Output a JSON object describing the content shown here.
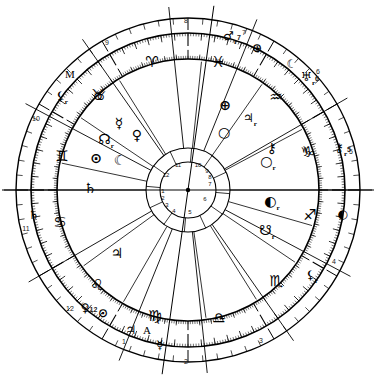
{
  "chart": {
    "type": "astrological-natal-wheel",
    "center_dot": true,
    "rings": {
      "outer_circle_r": 172,
      "zodiac_band_outer_r": 157,
      "zodiac_band_inner_r": 131,
      "inner_house_ring_outer_r": 42,
      "inner_house_ring_inner_r": 28
    }
  },
  "angles": [
    {
      "name": "midheaven",
      "label": "M",
      "x": 70,
      "y": 74
    },
    {
      "name": "ascendant",
      "label": "A",
      "x": 147,
      "y": 330
    }
  ],
  "zodiac_signs": [
    {
      "name": "aries",
      "glyph": "♈",
      "x": 152,
      "y": 62
    },
    {
      "name": "pisces",
      "glyph": "♓",
      "x": 218,
      "y": 62
    },
    {
      "name": "aquarius",
      "glyph": "♒",
      "x": 276,
      "y": 97
    },
    {
      "name": "capricorn",
      "glyph": "♑",
      "x": 309,
      "y": 152
    },
    {
      "name": "sagittarius",
      "glyph": "♐",
      "x": 310,
      "y": 215
    },
    {
      "name": "scorpio",
      "glyph": "♏",
      "x": 276,
      "y": 281
    },
    {
      "name": "libra",
      "glyph": "♎",
      "x": 219,
      "y": 318
    },
    {
      "name": "virgo",
      "glyph": "♍",
      "x": 155,
      "y": 316
    },
    {
      "name": "leo",
      "glyph": "♌",
      "x": 97,
      "y": 285
    },
    {
      "name": "cancer",
      "glyph": "♋",
      "x": 60,
      "y": 222
    },
    {
      "name": "gemini",
      "glyph": "♊",
      "x": 62,
      "y": 156
    },
    {
      "name": "taurus",
      "glyph": "♉",
      "x": 98,
      "y": 95
    }
  ],
  "planets_inner": [
    {
      "name": "mercury",
      "glyph": "☿",
      "retro": "",
      "x": 119,
      "y": 123
    },
    {
      "name": "venus",
      "glyph": "♀",
      "retro": "",
      "x": 137,
      "y": 135
    },
    {
      "name": "north-node",
      "glyph": "☊",
      "retro": "r",
      "x": 106,
      "y": 141
    },
    {
      "name": "sun",
      "glyph": "⊙",
      "retro": "",
      "x": 96,
      "y": 158
    },
    {
      "name": "moon",
      "glyph": "☾",
      "retro": "",
      "x": 120,
      "y": 160
    },
    {
      "name": "saturn",
      "glyph": "♄",
      "retro": "",
      "x": 90,
      "y": 188
    },
    {
      "name": "jupiter",
      "glyph": "♃",
      "retro": "",
      "x": 117,
      "y": 253
    },
    {
      "name": "neptune",
      "glyph": "⊕",
      "retro": "",
      "x": 225,
      "y": 105
    },
    {
      "name": "uranus",
      "glyph": "○",
      "retro": "",
      "x": 224,
      "y": 132
    },
    {
      "name": "chiron",
      "glyph": "⚷",
      "retro": "",
      "x": 272,
      "y": 148
    },
    {
      "name": "venus-outer",
      "glyph": "○",
      "retro": "r",
      "x": 268,
      "y": 163
    },
    {
      "name": "pluto",
      "glyph": "◐",
      "retro": "r",
      "x": 272,
      "y": 203
    },
    {
      "name": "south-node",
      "glyph": "☋",
      "retro": "r",
      "x": 267,
      "y": 232
    }
  ],
  "planets_outer": [
    {
      "name": "mars",
      "glyph": "♂",
      "retro": "r",
      "house": "7",
      "x": 232,
      "y": 38
    },
    {
      "name": "neptune-out",
      "glyph": "⊕",
      "retro": "",
      "house": "",
      "x": 257,
      "y": 48
    },
    {
      "name": "moon-out",
      "glyph": "☾",
      "retro": "",
      "house": "",
      "x": 292,
      "y": 64
    },
    {
      "name": "uranus-out",
      "glyph": "♅",
      "retro": "r",
      "house": "6",
      "x": 310,
      "y": 79
    },
    {
      "name": "jupiter-out",
      "glyph": "♃",
      "retro": "r",
      "house": "",
      "x": 250,
      "y": 120
    },
    {
      "name": "chiron-out",
      "glyph": "⚷",
      "retro": "r",
      "house": "5",
      "x": 343,
      "y": 150
    },
    {
      "name": "capricorn-o",
      "glyph": "♑",
      "retro": "",
      "house": "",
      "x": 306,
      "y": 152
    },
    {
      "name": "pluto-out",
      "glyph": "◐",
      "retro": "",
      "house": "",
      "x": 343,
      "y": 214
    },
    {
      "name": "lilith-out",
      "glyph": "⚸",
      "retro": "r",
      "house": "",
      "x": 312,
      "y": 277
    },
    {
      "name": "lilith-ul",
      "glyph": "⚸",
      "retro": "r",
      "house": "",
      "x": 62,
      "y": 98
    },
    {
      "name": "taurus-out",
      "glyph": "♉",
      "retro": "",
      "house": "",
      "x": 101,
      "y": 96
    },
    {
      "name": "saturn-out",
      "glyph": "♄",
      "retro": "",
      "house": "",
      "x": 34,
      "y": 215
    },
    {
      "name": "venus-out12",
      "glyph": "♀",
      "retro": "",
      "house": "12",
      "x": 89,
      "y": 308
    },
    {
      "name": "sun-out",
      "glyph": "⊙",
      "retro": "",
      "house": "",
      "x": 103,
      "y": 313
    },
    {
      "name": "jupiter-asc",
      "glyph": "♃",
      "retro": "",
      "house": "",
      "x": 131,
      "y": 330
    },
    {
      "name": "mercury-out",
      "glyph": "☿",
      "retro": "",
      "house": "",
      "x": 160,
      "y": 345
    }
  ],
  "house_numbers_outer": [
    {
      "num": "8",
      "x": 186,
      "y": 20
    },
    {
      "num": "9",
      "x": 107,
      "y": 42
    },
    {
      "num": "10",
      "x": 36,
      "y": 118
    },
    {
      "num": "11",
      "x": 26,
      "y": 228
    },
    {
      "num": "1",
      "x": 124,
      "y": 341
    },
    {
      "num": "2",
      "x": 186,
      "y": 361
    },
    {
      "num": "3",
      "x": 261,
      "y": 340
    },
    {
      "num": "4",
      "x": 334,
      "y": 261
    },
    {
      "num": "5",
      "x": 351,
      "y": 151
    },
    {
      "num": "7",
      "x": 244,
      "y": 32
    },
    {
      "num": "6",
      "x": 318,
      "y": 71
    },
    {
      "num": "12",
      "x": 70,
      "y": 308
    }
  ],
  "house_numbers_inner": [
    {
      "num": "11",
      "x": 178,
      "y": 165
    },
    {
      "num": "10",
      "x": 198,
      "y": 165
    },
    {
      "num": "9",
      "x": 207,
      "y": 171
    },
    {
      "num": "8",
      "x": 210,
      "y": 177
    },
    {
      "num": "7",
      "x": 210,
      "y": 184
    },
    {
      "num": "12",
      "x": 166,
      "y": 175
    },
    {
      "num": "6",
      "x": 205,
      "y": 199
    },
    {
      "num": "5",
      "x": 190,
      "y": 212
    },
    {
      "num": "4",
      "x": 174,
      "y": 211
    },
    {
      "num": "3",
      "x": 167,
      "y": 205
    },
    {
      "num": "2",
      "x": 163,
      "y": 198
    },
    {
      "num": "1",
      "x": 163,
      "y": 191
    }
  ],
  "colors": {
    "stroke": "#000000",
    "background": "#ffffff",
    "tick": "#000000"
  }
}
